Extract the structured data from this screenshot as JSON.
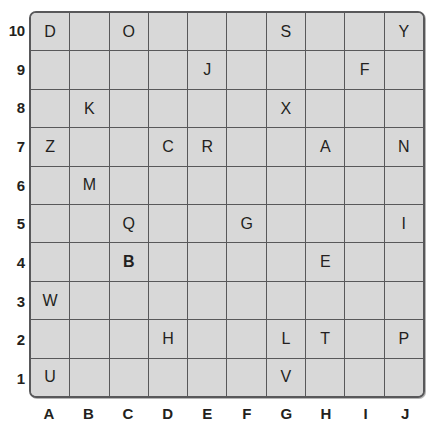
{
  "board": {
    "title": "Letter Grid",
    "columns": [
      "A",
      "B",
      "C",
      "D",
      "E",
      "F",
      "G",
      "H",
      "I",
      "J"
    ],
    "rows": [
      "10",
      "9",
      "8",
      "7",
      "6",
      "5",
      "4",
      "3",
      "2",
      "1"
    ],
    "cell_fill_color": "#d8d8d8",
    "grid_line_color": "#58585a",
    "text_color": "#231f20",
    "cells": [
      [
        {
          "letter": "D",
          "bold": false
        },
        {
          "letter": "",
          "bold": false
        },
        {
          "letter": "O",
          "bold": false
        },
        {
          "letter": "",
          "bold": false
        },
        {
          "letter": "",
          "bold": false
        },
        {
          "letter": "",
          "bold": false
        },
        {
          "letter": "S",
          "bold": false
        },
        {
          "letter": "",
          "bold": false
        },
        {
          "letter": "",
          "bold": false
        },
        {
          "letter": "Y",
          "bold": false
        }
      ],
      [
        {
          "letter": "",
          "bold": false
        },
        {
          "letter": "",
          "bold": false
        },
        {
          "letter": "",
          "bold": false
        },
        {
          "letter": "",
          "bold": false
        },
        {
          "letter": "J",
          "bold": false
        },
        {
          "letter": "",
          "bold": false
        },
        {
          "letter": "",
          "bold": false
        },
        {
          "letter": "",
          "bold": false
        },
        {
          "letter": "F",
          "bold": false
        },
        {
          "letter": "",
          "bold": false
        }
      ],
      [
        {
          "letter": "",
          "bold": false
        },
        {
          "letter": "K",
          "bold": false
        },
        {
          "letter": "",
          "bold": false
        },
        {
          "letter": "",
          "bold": false
        },
        {
          "letter": "",
          "bold": false
        },
        {
          "letter": "",
          "bold": false
        },
        {
          "letter": "X",
          "bold": false
        },
        {
          "letter": "",
          "bold": false
        },
        {
          "letter": "",
          "bold": false
        },
        {
          "letter": "",
          "bold": false
        }
      ],
      [
        {
          "letter": "Z",
          "bold": false
        },
        {
          "letter": "",
          "bold": false
        },
        {
          "letter": "",
          "bold": false
        },
        {
          "letter": "C",
          "bold": false
        },
        {
          "letter": "R",
          "bold": false
        },
        {
          "letter": "",
          "bold": false
        },
        {
          "letter": "",
          "bold": false
        },
        {
          "letter": "A",
          "bold": false
        },
        {
          "letter": "",
          "bold": false
        },
        {
          "letter": "N",
          "bold": false
        }
      ],
      [
        {
          "letter": "",
          "bold": false
        },
        {
          "letter": "M",
          "bold": false
        },
        {
          "letter": "",
          "bold": false
        },
        {
          "letter": "",
          "bold": false
        },
        {
          "letter": "",
          "bold": false
        },
        {
          "letter": "",
          "bold": false
        },
        {
          "letter": "",
          "bold": false
        },
        {
          "letter": "",
          "bold": false
        },
        {
          "letter": "",
          "bold": false
        },
        {
          "letter": "",
          "bold": false
        }
      ],
      [
        {
          "letter": "",
          "bold": false
        },
        {
          "letter": "",
          "bold": false
        },
        {
          "letter": "Q",
          "bold": false
        },
        {
          "letter": "",
          "bold": false
        },
        {
          "letter": "",
          "bold": false
        },
        {
          "letter": "G",
          "bold": false
        },
        {
          "letter": "",
          "bold": false
        },
        {
          "letter": "",
          "bold": false
        },
        {
          "letter": "",
          "bold": false
        },
        {
          "letter": "I",
          "bold": false
        }
      ],
      [
        {
          "letter": "",
          "bold": false
        },
        {
          "letter": "",
          "bold": false
        },
        {
          "letter": "B",
          "bold": true
        },
        {
          "letter": "",
          "bold": false
        },
        {
          "letter": "",
          "bold": false
        },
        {
          "letter": "",
          "bold": false
        },
        {
          "letter": "",
          "bold": false
        },
        {
          "letter": "E",
          "bold": false
        },
        {
          "letter": "",
          "bold": false
        },
        {
          "letter": "",
          "bold": false
        }
      ],
      [
        {
          "letter": "W",
          "bold": false
        },
        {
          "letter": "",
          "bold": false
        },
        {
          "letter": "",
          "bold": false
        },
        {
          "letter": "",
          "bold": false
        },
        {
          "letter": "",
          "bold": false
        },
        {
          "letter": "",
          "bold": false
        },
        {
          "letter": "",
          "bold": false
        },
        {
          "letter": "",
          "bold": false
        },
        {
          "letter": "",
          "bold": false
        },
        {
          "letter": "",
          "bold": false
        }
      ],
      [
        {
          "letter": "",
          "bold": false
        },
        {
          "letter": "",
          "bold": false
        },
        {
          "letter": "",
          "bold": false
        },
        {
          "letter": "H",
          "bold": false
        },
        {
          "letter": "",
          "bold": false
        },
        {
          "letter": "",
          "bold": false
        },
        {
          "letter": "L",
          "bold": false
        },
        {
          "letter": "T",
          "bold": false
        },
        {
          "letter": "",
          "bold": false
        },
        {
          "letter": "P",
          "bold": false
        }
      ],
      [
        {
          "letter": "U",
          "bold": false
        },
        {
          "letter": "",
          "bold": false
        },
        {
          "letter": "",
          "bold": false
        },
        {
          "letter": "",
          "bold": false
        },
        {
          "letter": "",
          "bold": false
        },
        {
          "letter": "",
          "bold": false
        },
        {
          "letter": "V",
          "bold": false
        },
        {
          "letter": "",
          "bold": false
        },
        {
          "letter": "",
          "bold": false
        },
        {
          "letter": "",
          "bold": false
        }
      ]
    ]
  }
}
